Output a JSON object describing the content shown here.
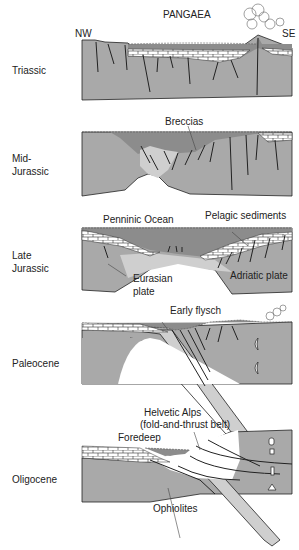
{
  "colors": {
    "crust": "#a9a9a9",
    "ocean": "#8c8c8c",
    "light_crust": "#cfcfcf",
    "sediment": "#ffffff",
    "outline": "#222222"
  },
  "orientation": {
    "left": "NW",
    "right": "SE"
  },
  "panels": [
    {
      "stage": "Triassic",
      "labels": [
        "PANGAEA",
        "NW",
        "SE"
      ]
    },
    {
      "stage": "Mid-Jurassic",
      "stage_lines": [
        "Mid-",
        "Jurassic"
      ],
      "labels": [
        "Breccias"
      ]
    },
    {
      "stage": "Late Jurassic",
      "stage_lines": [
        "Late",
        "Jurassic"
      ],
      "labels": [
        "Penninic Ocean",
        "Pelagic sediments",
        "Eurasian plate",
        "Adriatic plate"
      ]
    },
    {
      "stage": "Paleocene",
      "labels": [
        "Early flysch"
      ]
    },
    {
      "stage": "Oligocene",
      "labels": [
        "Helvetic Alps (fold-and-thrust belt)",
        "Foredeep",
        "Ophiolites"
      ]
    }
  ],
  "text": {
    "pangaea": "PANGAEA",
    "nw": "NW",
    "se": "SE",
    "triassic": "Triassic",
    "mid": "Mid-",
    "jurassic1": "Jurassic",
    "breccias": "Breccias",
    "late": "Late",
    "jurassic2": "Jurassic",
    "penninic": "Penninic Ocean",
    "pelagic": "Pelagic sediments",
    "eurasian1": "Eurasian",
    "eurasian2": "plate",
    "adriatic": "Adriatic plate",
    "paleocene": "Paleocene",
    "flysch": "Early flysch",
    "helvetic1": "Helvetic Alps",
    "helvetic2": "(fold-and-thrust belt)",
    "foredeep": "Foredeep",
    "oligocene": "Oligocene",
    "ophiolites": "Ophiolites"
  }
}
